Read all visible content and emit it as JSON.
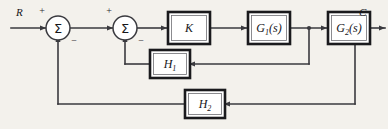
{
  "diagram": {
    "background_color": "#f3f1ec",
    "line_color": "#3a3a3f",
    "block_fill": "#ffffff",
    "block_border_color": "#1a1a1d",
    "signals": {
      "input_label": "R",
      "output_label": "C"
    },
    "summing_junctions": [
      {
        "name": "summer-1",
        "glyph": "Σ",
        "input_sign": "+",
        "feedback_sign": "−"
      },
      {
        "name": "summer-2",
        "glyph": "Σ",
        "input_sign": "+",
        "feedback_sign": "−"
      }
    ],
    "blocks": [
      {
        "name": "gain-block-k",
        "label": "K",
        "subscript": "",
        "suffix": ""
      },
      {
        "name": "forward-block-g1",
        "label": "G",
        "subscript": "1",
        "suffix": "(s)"
      },
      {
        "name": "forward-block-g2",
        "label": "G",
        "subscript": "2",
        "suffix": "(s)"
      },
      {
        "name": "feedback-block-h1",
        "label": "H",
        "subscript": "1",
        "suffix": ""
      },
      {
        "name": "feedback-block-h2",
        "label": "H",
        "subscript": "2",
        "suffix": ""
      }
    ]
  }
}
